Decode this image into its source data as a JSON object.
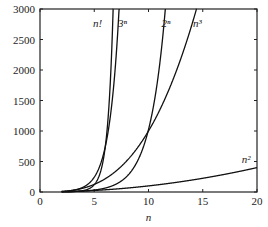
{
  "chart_data": {
    "type": "line",
    "title": "",
    "xlabel": "n",
    "ylabel": "",
    "xlim": [
      0,
      20
    ],
    "ylim": [
      0,
      3000
    ],
    "xticks": [
      0,
      5,
      10,
      15,
      20
    ],
    "xtick_labels": [
      "0",
      "5",
      "10",
      "15",
      "20"
    ],
    "yticks": [
      0,
      500,
      1000,
      1500,
      2000,
      2500,
      3000
    ],
    "ytick_labels": [
      "0",
      "500",
      "1000",
      "1500",
      "2000",
      "2500",
      "3000"
    ],
    "grid": false,
    "legend": "none (inline curve labels)",
    "series": [
      {
        "name": "n!",
        "label": "n!",
        "formula": "factorial",
        "x": [
          2,
          3,
          4,
          5,
          6,
          7
        ],
        "y": [
          2,
          6,
          24,
          120,
          720,
          5040
        ]
      },
      {
        "name": "3^n",
        "label": "3ⁿ",
        "formula": "3^n",
        "x": [
          2,
          3,
          4,
          5,
          6,
          7,
          7.3
        ],
        "y": [
          9,
          27,
          81,
          243,
          729,
          2187,
          3000
        ]
      },
      {
        "name": "2^n",
        "label": "2ⁿ",
        "formula": "2^n",
        "x": [
          2,
          4,
          6,
          8,
          10,
          11,
          11.55
        ],
        "y": [
          4,
          16,
          64,
          256,
          1024,
          2048,
          3000
        ]
      },
      {
        "name": "n^3",
        "label": "n³",
        "formula": "n^3",
        "x": [
          2,
          4,
          6,
          8,
          10,
          12,
          14,
          14.42
        ],
        "y": [
          8,
          64,
          216,
          512,
          1000,
          1728,
          2744,
          3000
        ]
      },
      {
        "name": "n^2",
        "label": "n²",
        "formula": "n^2",
        "x": [
          2,
          5,
          10,
          15,
          20
        ],
        "y": [
          4,
          25,
          100,
          225,
          400
        ]
      }
    ],
    "annotations": [
      {
        "text": "n!",
        "x": 5.3,
        "y": 2700
      },
      {
        "text": "3ⁿ",
        "x": 7.6,
        "y": 2700
      },
      {
        "text": "2ⁿ",
        "x": 11.6,
        "y": 2700
      },
      {
        "text": "n³",
        "x": 14.5,
        "y": 2700
      },
      {
        "text": "n²",
        "x": 19.0,
        "y": 470
      }
    ]
  }
}
